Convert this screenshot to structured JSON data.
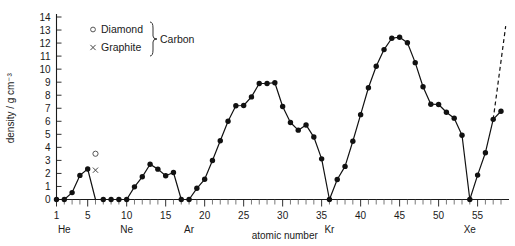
{
  "chart_data": {
    "type": "line",
    "title": "",
    "xlabel": "atomic number",
    "ylabel": "density / g cm⁻³",
    "xlim": [
      1,
      58
    ],
    "ylim": [
      0,
      14
    ],
    "grid": false,
    "legend_position": "top-left-inside",
    "y_ticks": [
      0,
      1,
      2,
      3,
      4,
      5,
      6,
      7,
      8,
      9,
      10,
      11,
      12,
      13,
      14
    ],
    "y_tick_labels": [
      "0",
      "1",
      "2",
      "3",
      "4",
      "5",
      "6",
      "7",
      "8",
      "9",
      "10",
      "11",
      "12",
      "13",
      "14"
    ],
    "x_ticks": [
      1,
      5,
      10,
      15,
      20,
      25,
      30,
      35,
      40,
      45,
      50,
      55
    ],
    "x_tick_labels": [
      "1",
      "5",
      "10",
      "15",
      "20",
      "25",
      "30",
      "35",
      "40",
      "45",
      "50",
      "55"
    ],
    "x_minor_tick_step": 1,
    "noble_gas_labels": [
      {
        "x": 2,
        "label": "He"
      },
      {
        "x": 10,
        "label": "Ne"
      },
      {
        "x": 18,
        "label": "Ar"
      },
      {
        "x": 36,
        "label": "Kr"
      },
      {
        "x": 54,
        "label": "Xe"
      }
    ],
    "legend": [
      {
        "marker": "open-circle",
        "label": "Diamond"
      },
      {
        "marker": "cross",
        "label": "Graphite"
      }
    ],
    "legend_group_label": "Carbon",
    "series": [
      {
        "name": "density",
        "marker": "filled-circle",
        "x": [
          1,
          2,
          3,
          4,
          5,
          6,
          7,
          8,
          9,
          10,
          11,
          12,
          13,
          14,
          15,
          16,
          17,
          18,
          19,
          20,
          21,
          22,
          23,
          24,
          25,
          26,
          27,
          28,
          29,
          30,
          31,
          32,
          33,
          34,
          35,
          36,
          37,
          38,
          39,
          40,
          41,
          42,
          43,
          44,
          45,
          46,
          47,
          48,
          49,
          50,
          51,
          52,
          53,
          54,
          55,
          56,
          57,
          58
        ],
        "values": [
          0.0,
          0.0,
          0.53,
          1.85,
          2.34,
          0.0,
          0.0,
          0.0,
          0.0,
          0.0,
          0.97,
          1.74,
          2.7,
          2.33,
          1.82,
          2.07,
          0.0,
          0.0,
          0.86,
          1.55,
          2.99,
          4.51,
          6.0,
          7.19,
          7.21,
          7.87,
          8.9,
          8.9,
          8.96,
          7.13,
          5.91,
          5.32,
          5.72,
          4.79,
          3.12,
          0.0,
          1.53,
          2.54,
          4.47,
          6.51,
          8.57,
          10.22,
          11.5,
          12.37,
          12.45,
          12.02,
          10.5,
          8.65,
          7.31,
          7.29,
          6.69,
          6.24,
          4.93,
          0.0,
          1.87,
          3.59,
          6.15,
          6.77
        ],
        "note": "element 6 (carbon) shown as open-circle diamond and cross graphite markers only"
      }
    ],
    "special_points": [
      {
        "x": 6,
        "y": 3.51,
        "marker": "open-circle",
        "label": "Diamond"
      },
      {
        "x": 6,
        "y": 2.25,
        "marker": "cross",
        "label": "Graphite"
      }
    ],
    "dashed_extension": {
      "from_x": 57,
      "from_y": 6.15,
      "to_x": 58.6,
      "to_y": 13.3,
      "description": "dashed line continuing upward past element 57"
    }
  }
}
